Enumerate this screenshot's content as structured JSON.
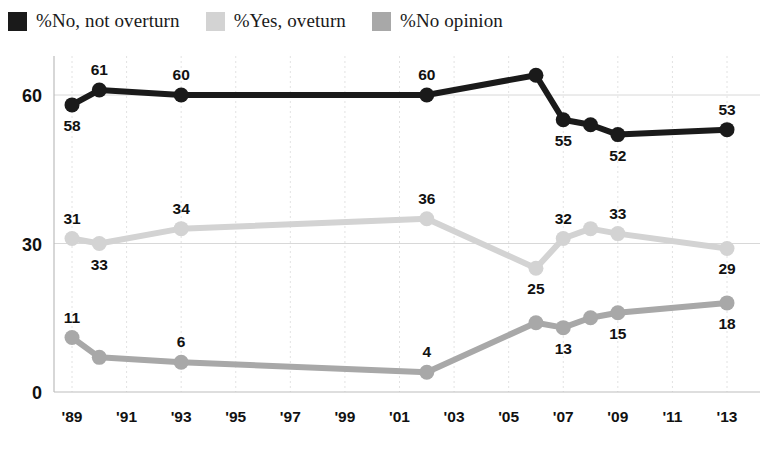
{
  "legend": {
    "position": "top-left",
    "items": [
      {
        "label": "%No, not overturn",
        "color": "#1a1a1a",
        "swatch": "legend-swatch-no-not-overturn"
      },
      {
        "label": "%Yes, oveturn",
        "color": "#d3d3d3",
        "swatch": "legend-swatch-yes-overturn"
      },
      {
        "label": "%No opinion",
        "color": "#a8a8a8",
        "swatch": "legend-swatch-no-opinion"
      }
    ]
  },
  "chart_data": {
    "type": "line",
    "title": "",
    "subtitle": "",
    "xlabel": "",
    "ylabel": "",
    "xlim": [
      1989,
      2013
    ],
    "ylim": [
      0,
      70
    ],
    "grid": "horizontal-and-vertical",
    "legend_position": "top-left",
    "x_tick_labels": [
      "'89",
      "'91",
      "'93",
      "'95",
      "'97",
      "'99",
      "'01",
      "'03",
      "'05",
      "'07",
      "'09",
      "'11",
      "'13"
    ],
    "x_ticks": [
      1989,
      1991,
      1993,
      1995,
      1997,
      1999,
      2001,
      2003,
      2005,
      2007,
      2009,
      2011,
      2013
    ],
    "y_ticks": [
      0,
      30,
      60
    ],
    "y_tick_labels": [
      "0",
      "30",
      "60"
    ],
    "series": [
      {
        "name": "%No, not overturn",
        "color": "#1a1a1a",
        "points": [
          {
            "x": 1989,
            "y": 58,
            "label": "58",
            "label_pos": "below"
          },
          {
            "x": 1990,
            "y": 61,
            "label": "61",
            "label_pos": "above"
          },
          {
            "x": 1993,
            "y": 60,
            "label": "60",
            "label_pos": "above"
          },
          {
            "x": 2002,
            "y": 60,
            "label": "60",
            "label_pos": "above"
          },
          {
            "x": 2006,
            "y": 64,
            "label": "",
            "label_pos": "above"
          },
          {
            "x": 2007,
            "y": 55,
            "label": "55",
            "label_pos": "below"
          },
          {
            "x": 2008,
            "y": 54,
            "label": "",
            "label_pos": "below"
          },
          {
            "x": 2009,
            "y": 52,
            "label": "52",
            "label_pos": "below"
          },
          {
            "x": 2013,
            "y": 53,
            "label": "53",
            "label_pos": "above"
          }
        ]
      },
      {
        "name": "%Yes, oveturn",
        "color": "#d3d3d3",
        "points": [
          {
            "x": 1989,
            "y": 31,
            "label": "31",
            "label_pos": "above"
          },
          {
            "x": 1990,
            "y": 30,
            "label": "33",
            "label_pos": "below"
          },
          {
            "x": 1993,
            "y": 33,
            "label": "34",
            "label_pos": "above"
          },
          {
            "x": 2002,
            "y": 35,
            "label": "36",
            "label_pos": "above"
          },
          {
            "x": 2006,
            "y": 25,
            "label": "25",
            "label_pos": "below"
          },
          {
            "x": 2007,
            "y": 31,
            "label": "32",
            "label_pos": "above"
          },
          {
            "x": 2008,
            "y": 33,
            "label": "",
            "label_pos": "above"
          },
          {
            "x": 2009,
            "y": 32,
            "label": "33",
            "label_pos": "above"
          },
          {
            "x": 2013,
            "y": 29,
            "label": "29",
            "label_pos": "below"
          }
        ]
      },
      {
        "name": "%No opinion",
        "color": "#a8a8a8",
        "points": [
          {
            "x": 1989,
            "y": 11,
            "label": "11",
            "label_pos": "above"
          },
          {
            "x": 1990,
            "y": 7,
            "label": "",
            "label_pos": "below"
          },
          {
            "x": 1993,
            "y": 6,
            "label": "6",
            "label_pos": "above"
          },
          {
            "x": 2002,
            "y": 4,
            "label": "4",
            "label_pos": "above"
          },
          {
            "x": 2006,
            "y": 14,
            "label": "",
            "label_pos": "above"
          },
          {
            "x": 2007,
            "y": 13,
            "label": "13",
            "label_pos": "below"
          },
          {
            "x": 2008,
            "y": 15,
            "label": "",
            "label_pos": "above"
          },
          {
            "x": 2009,
            "y": 16,
            "label": "15",
            "label_pos": "below"
          },
          {
            "x": 2013,
            "y": 18,
            "label": "18",
            "label_pos": "below"
          }
        ]
      }
    ]
  }
}
